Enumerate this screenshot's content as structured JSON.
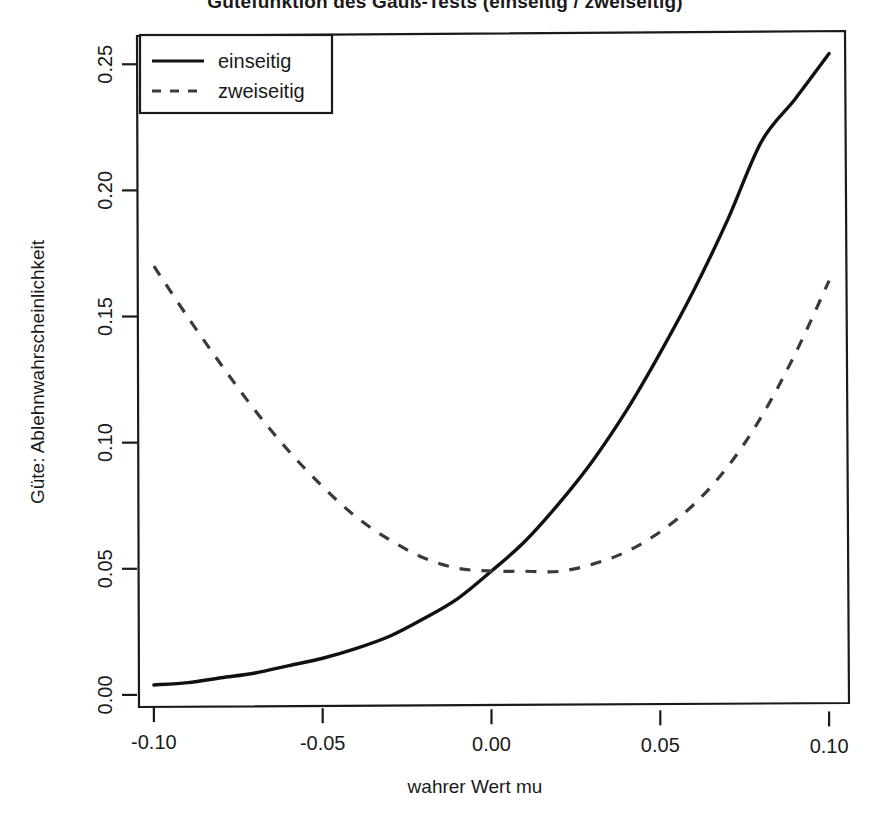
{
  "chart_data": {
    "type": "line",
    "title": "Gütefunktion des Gauß-Tests (einseitig / zweiseitig)",
    "xlabel": "wahrer Wert mu",
    "ylabel": "Güte: Ablehnwahrscheinlichkeit",
    "xlim": [
      -0.105,
      0.105
    ],
    "ylim": [
      -0.004,
      0.262
    ],
    "xticks": [
      -0.1,
      -0.05,
      0.0,
      0.05,
      0.1
    ],
    "xtick_labels": [
      "-0.10",
      "-0.05",
      "0.00",
      "0.05",
      "0.10"
    ],
    "yticks": [
      0.0,
      0.05,
      0.1,
      0.15,
      0.2,
      0.25
    ],
    "ytick_labels": [
      "0.00",
      "0.05",
      "0.10",
      "0.15",
      "0.20",
      "0.25"
    ],
    "grid": false,
    "legend_position": "top-left",
    "legend_entries": [
      {
        "label": "einseitig",
        "style": "solid",
        "color": "#111111"
      },
      {
        "label": "zweiseitig",
        "style": "dashed",
        "color": "#3a3a3a"
      }
    ],
    "x": [
      -0.1,
      -0.09,
      -0.08,
      -0.07,
      -0.06,
      -0.05,
      -0.04,
      -0.03,
      -0.02,
      -0.01,
      0.0,
      0.01,
      0.02,
      0.03,
      0.04,
      0.05,
      0.06,
      0.07,
      0.08,
      0.09,
      0.1
    ],
    "series": [
      {
        "name": "einseitig",
        "style": "solid",
        "color": "#111111",
        "values": [
          0.004,
          0.005,
          0.007,
          0.009,
          0.012,
          0.015,
          0.019,
          0.024,
          0.031,
          0.039,
          0.05,
          0.062,
          0.077,
          0.094,
          0.114,
          0.137,
          0.162,
          0.19,
          0.221,
          0.238,
          0.256
        ]
      },
      {
        "name": "zweiseitig",
        "style": "dashed",
        "color": "#3a3a3a",
        "values": [
          0.17,
          0.15,
          0.131,
          0.113,
          0.097,
          0.083,
          0.071,
          0.062,
          0.055,
          0.051,
          0.05,
          0.05,
          0.05,
          0.053,
          0.058,
          0.066,
          0.077,
          0.092,
          0.112,
          0.137,
          0.166
        ]
      }
    ]
  }
}
